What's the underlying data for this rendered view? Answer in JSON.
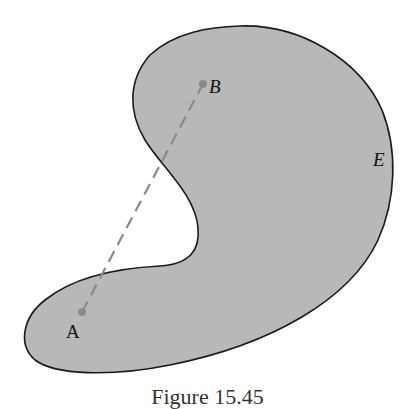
{
  "figure": {
    "region_label": "E",
    "point_a_label": "A",
    "point_b_label": "B",
    "caption": "Figure 15.45",
    "colors": {
      "region_fill": "#b8b8b8",
      "outline": "#1a1a1a",
      "segment": "#8a8a8a",
      "point": "#8a8a8a"
    }
  }
}
